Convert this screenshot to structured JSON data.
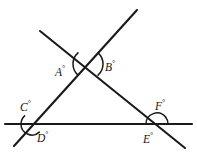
{
  "figure": {
    "width": 197,
    "height": 155,
    "background_color": "#ffffff",
    "stroke_color": "#1a1a1a",
    "text_color": "#141414",
    "degree_symbol": "°",
    "lines": [
      {
        "name": "horizontal-line",
        "x1": 5,
        "y1": 124,
        "x2": 192,
        "y2": 124
      },
      {
        "name": "rising-diagonal-line",
        "x1": 14,
        "y1": 146,
        "x2": 137,
        "y2": 10
      },
      {
        "name": "falling-diagonal-line",
        "x1": 40,
        "y1": 31,
        "x2": 185,
        "y2": 148
      }
    ],
    "vertices": [
      {
        "name": "apex-vertex",
        "x": 88,
        "y": 64
      },
      {
        "name": "left-base-vertex",
        "x": 32,
        "y": 124
      },
      {
        "name": "right-base-vertex",
        "x": 157,
        "y": 124
      }
    ],
    "arcs": [
      {
        "name": "arc-A",
        "cx": 88,
        "cy": 64,
        "r": 15,
        "start_deg": 132,
        "end_deg": 228
      },
      {
        "name": "arc-B",
        "cx": 88,
        "cy": 64,
        "r": 15,
        "start_deg": 312,
        "end_deg": 408
      },
      {
        "name": "arc-C",
        "cx": 32,
        "cy": 124,
        "r": 11,
        "start_deg": 180,
        "end_deg": 228
      },
      {
        "name": "arc-D",
        "cx": 32,
        "cy": 124,
        "r": 11,
        "start_deg": 48,
        "end_deg": 180
      },
      {
        "name": "arc-F",
        "cx": 157,
        "cy": 124,
        "r": 11,
        "start_deg": 321,
        "end_deg": 360
      },
      {
        "name": "arc-E",
        "cx": 157,
        "cy": 124,
        "r": 11,
        "start_deg": 180,
        "end_deg": 321
      }
    ],
    "labels": {
      "A": {
        "letter": "A",
        "degree": "°",
        "x": 55,
        "y": 65
      },
      "B": {
        "letter": "B",
        "degree": "°",
        "x": 105,
        "y": 60
      },
      "C": {
        "letter": "C",
        "degree": "°",
        "x": 20,
        "y": 100
      },
      "D": {
        "letter": "D",
        "degree": "°",
        "x": 37,
        "y": 131
      },
      "E": {
        "letter": "E",
        "degree": "°",
        "x": 143,
        "y": 132
      },
      "F": {
        "letter": "F",
        "degree": "°",
        "x": 155,
        "y": 99
      }
    }
  }
}
